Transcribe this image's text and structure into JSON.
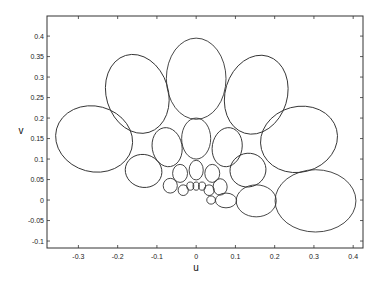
{
  "chart_data": {
    "type": "scatter",
    "subtype": "ellipses",
    "title": "",
    "xlabel": "u",
    "ylabel": "v",
    "xlim": [
      -0.38,
      0.425
    ],
    "ylim": [
      -0.117,
      0.449
    ],
    "grid": false,
    "legend": null,
    "xticks": [
      -0.3,
      -0.2,
      -0.1,
      0,
      0.1,
      0.2,
      0.3,
      0.4
    ],
    "xtick_labels": [
      "-0.3",
      "-0.2",
      "-0.1",
      "0",
      "0.1",
      "0.2",
      "0.3",
      "0.4"
    ],
    "yticks": [
      -0.1,
      -0.05,
      0,
      0.05,
      0.1,
      0.15,
      0.2,
      0.25,
      0.3,
      0.35,
      0.4
    ],
    "ytick_labels": [
      "-0.1",
      "-0.05",
      "0",
      "0.05",
      "0.1",
      "0.15",
      "0.2",
      "0.25",
      "0.3",
      "0.35",
      "0.4"
    ],
    "ellipses": [
      {
        "u": -0.26,
        "v": 0.149,
        "ru": 0.099,
        "rv": 0.08,
        "angle": 15
      },
      {
        "u": -0.15,
        "v": 0.259,
        "ru": 0.079,
        "rv": 0.098,
        "angle": -17
      },
      {
        "u": 0.0,
        "v": 0.296,
        "ru": 0.076,
        "rv": 0.099,
        "angle": 0
      },
      {
        "u": 0.153,
        "v": 0.257,
        "ru": 0.079,
        "rv": 0.098,
        "angle": 17
      },
      {
        "u": 0.262,
        "v": 0.148,
        "ru": 0.099,
        "rv": 0.08,
        "angle": -15
      },
      {
        "u": -0.074,
        "v": 0.129,
        "ru": 0.038,
        "rv": 0.048,
        "angle": -10
      },
      {
        "u": 0.0,
        "v": 0.15,
        "ru": 0.037,
        "rv": 0.05,
        "angle": 0
      },
      {
        "u": 0.079,
        "v": 0.129,
        "ru": 0.038,
        "rv": 0.048,
        "angle": 10
      },
      {
        "u": -0.134,
        "v": 0.071,
        "ru": 0.047,
        "rv": 0.04,
        "angle": 15
      },
      {
        "u": 0.132,
        "v": 0.073,
        "ru": 0.046,
        "rv": 0.041,
        "angle": -15
      },
      {
        "u": -0.041,
        "v": 0.065,
        "ru": 0.019,
        "rv": 0.022,
        "angle": 0
      },
      {
        "u": 0.0,
        "v": 0.073,
        "ru": 0.018,
        "rv": 0.024,
        "angle": 0
      },
      {
        "u": 0.041,
        "v": 0.065,
        "ru": 0.019,
        "rv": 0.022,
        "angle": 0
      },
      {
        "u": -0.066,
        "v": 0.035,
        "ru": 0.018,
        "rv": 0.018,
        "angle": 0
      },
      {
        "u": -0.033,
        "v": 0.024,
        "ru": 0.013,
        "rv": 0.013,
        "angle": 0
      },
      {
        "u": -0.015,
        "v": 0.034,
        "ru": 0.009,
        "rv": 0.01,
        "angle": 0
      },
      {
        "u": 0.0,
        "v": 0.034,
        "ru": 0.008,
        "rv": 0.01,
        "angle": 0
      },
      {
        "u": 0.015,
        "v": 0.034,
        "ru": 0.009,
        "rv": 0.01,
        "angle": 0
      },
      {
        "u": 0.033,
        "v": 0.024,
        "ru": 0.013,
        "rv": 0.013,
        "angle": 0
      },
      {
        "u": 0.061,
        "v": 0.032,
        "ru": 0.018,
        "rv": 0.02,
        "angle": 0
      },
      {
        "u": 0.038,
        "v": 0.0,
        "ru": 0.011,
        "rv": 0.01,
        "angle": 0
      },
      {
        "u": 0.076,
        "v": -0.001,
        "ru": 0.027,
        "rv": 0.018,
        "angle": 0
      },
      {
        "u": 0.153,
        "v": -0.002,
        "ru": 0.051,
        "rv": 0.039,
        "angle": 0
      },
      {
        "u": 0.304,
        "v": -0.002,
        "ru": 0.103,
        "rv": 0.076,
        "angle": 0
      }
    ]
  },
  "axes": {
    "x_label": "u",
    "y_label": "v"
  }
}
